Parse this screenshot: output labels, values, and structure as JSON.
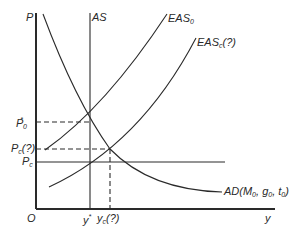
{
  "axes": {
    "y_label": "P",
    "x_label": "y",
    "origin_label": "O"
  },
  "curves": {
    "as": {
      "label": "AS"
    },
    "eas0": {
      "label": "EAS",
      "sub": "0"
    },
    "easc": {
      "label": "EAS",
      "sub": "c",
      "suffix": "(?)"
    },
    "ad": {
      "label": "AD(M",
      "sub1": "0",
      "mid1": ", g",
      "sub2": "0",
      "mid2": ", t",
      "sub3": "0",
      "end": ")"
    }
  },
  "price_levels": {
    "p0_star": {
      "label": "P",
      "sup": "*",
      "sub": "0"
    },
    "pc_q": {
      "label": "P",
      "sub": "c",
      "suffix": "(?)"
    },
    "pc": {
      "label": "P",
      "sub": "c"
    }
  },
  "output_levels": {
    "y_star": {
      "label": "y",
      "sup": "*"
    },
    "yc_q": {
      "label": "y",
      "sub": "c",
      "suffix": "(?)"
    }
  },
  "colors": {
    "line": "#2a2a2a",
    "background": "#ffffff"
  }
}
